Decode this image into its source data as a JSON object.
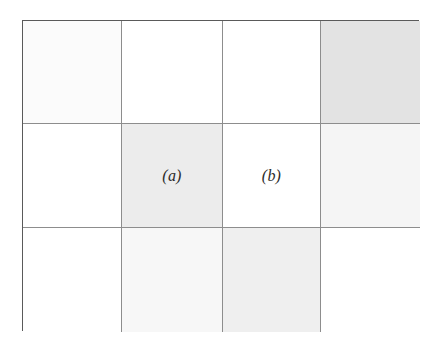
{
  "figure": {
    "type": "shaded-grid-diagram",
    "caption_labels": [
      "(a)",
      "(b)"
    ],
    "grid": {
      "columns": 4,
      "rows": 3,
      "frame_border_color": "#5a5a5a",
      "inner_line_color": "#8d8d8d",
      "background_color": "#ffffff"
    },
    "shades": {
      "white": "#ffffff",
      "very_faint": "#fbfbfb",
      "faint": "#f7f7f7",
      "light": "#f2f2f2",
      "medium": "#ececec",
      "dark": "#e3e3e3"
    },
    "cells": [
      {
        "row": 0,
        "col": 0,
        "shade": "#fbfbfb",
        "label": ""
      },
      {
        "row": 0,
        "col": 1,
        "shade": "#ffffff",
        "label": ""
      },
      {
        "row": 0,
        "col": 2,
        "shade": "#ffffff",
        "label": ""
      },
      {
        "row": 0,
        "col": 3,
        "shade": "#e3e3e3",
        "label": ""
      },
      {
        "row": 1,
        "col": 0,
        "shade": "#ffffff",
        "label": ""
      },
      {
        "row": 1,
        "col": 1,
        "shade": "#ececec",
        "label": "(a)"
      },
      {
        "row": 1,
        "col": 2,
        "shade": "#ffffff",
        "label": "(b)"
      },
      {
        "row": 1,
        "col": 3,
        "shade": "#f5f5f5",
        "label": ""
      },
      {
        "row": 2,
        "col": 0,
        "shade": "#ffffff",
        "label": ""
      },
      {
        "row": 2,
        "col": 1,
        "shade": "#f7f7f7",
        "label": ""
      },
      {
        "row": 2,
        "col": 2,
        "shade": "#efefef",
        "label": ""
      },
      {
        "row": 2,
        "col": 3,
        "shade": "#ffffff",
        "label": ""
      }
    ]
  }
}
